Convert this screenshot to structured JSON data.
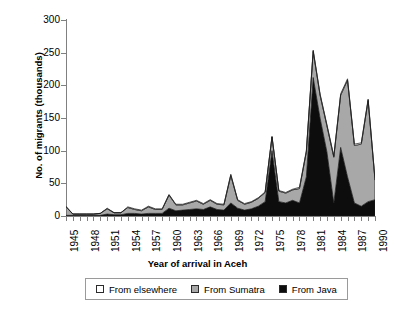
{
  "chart_data": {
    "type": "area",
    "stacked": true,
    "title": "",
    "xlabel": "Year of arrival in Aceh",
    "ylabel": "No. of migrants (thousands)",
    "ylim": [
      0,
      300
    ],
    "yticks": [
      0,
      50,
      100,
      150,
      200,
      250,
      300
    ],
    "xlim": [
      1945,
      1990
    ],
    "xticks": [
      1945,
      1948,
      1951,
      1954,
      1957,
      1960,
      1963,
      1966,
      1969,
      1972,
      1975,
      1978,
      1981,
      1984,
      1987,
      1990
    ],
    "grid": false,
    "legend_position": "bottom",
    "x": [
      1945,
      1946,
      1947,
      1948,
      1949,
      1950,
      1951,
      1952,
      1953,
      1954,
      1955,
      1956,
      1957,
      1958,
      1959,
      1960,
      1961,
      1962,
      1963,
      1964,
      1965,
      1966,
      1967,
      1968,
      1969,
      1970,
      1971,
      1972,
      1973,
      1974,
      1975,
      1976,
      1977,
      1978,
      1979,
      1980,
      1981,
      1982,
      1983,
      1984,
      1985,
      1986,
      1987,
      1988,
      1989,
      1990
    ],
    "series": [
      {
        "name": "From Java",
        "color": "#0d0d0d",
        "values": [
          1,
          1,
          1,
          1,
          1,
          1,
          3,
          2,
          2,
          4,
          4,
          3,
          4,
          4,
          4,
          12,
          8,
          9,
          10,
          11,
          10,
          14,
          10,
          9,
          20,
          12,
          9,
          11,
          15,
          22,
          100,
          22,
          20,
          24,
          20,
          60,
          212,
          150,
          98,
          20,
          105,
          60,
          20,
          15,
          22,
          25
        ]
      },
      {
        "name": "From Sumatra",
        "color": "#a8a8a8",
        "values": [
          13,
          2,
          2,
          2,
          2,
          3,
          8,
          3,
          3,
          9,
          6,
          5,
          10,
          6,
          6,
          20,
          9,
          8,
          10,
          12,
          8,
          10,
          8,
          8,
          42,
          12,
          9,
          10,
          12,
          14,
          21,
          16,
          15,
          16,
          22,
          38,
          40,
          35,
          40,
          70,
          80,
          148,
          88,
          95,
          155,
          30
        ]
      },
      {
        "name": "From elsewhere",
        "color": "#ffffff",
        "values": [
          1,
          0,
          0,
          0,
          0,
          0,
          1,
          0,
          0,
          1,
          1,
          1,
          1,
          1,
          1,
          1,
          1,
          1,
          1,
          1,
          1,
          1,
          1,
          1,
          2,
          1,
          1,
          1,
          1,
          1,
          1,
          1,
          1,
          1,
          2,
          2,
          2,
          2,
          2,
          2,
          2,
          2,
          2,
          2,
          2,
          2
        ]
      }
    ],
    "legend_entries": [
      {
        "label": "From elsewhere",
        "color": "#ffffff"
      },
      {
        "label": "From Sumatra",
        "color": "#a8a8a8"
      },
      {
        "label": "From Java",
        "color": "#0d0d0d"
      }
    ]
  },
  "axes": {
    "y_title": "No. of migrants (thousands)",
    "x_title": "Year of arrival in Aceh"
  }
}
